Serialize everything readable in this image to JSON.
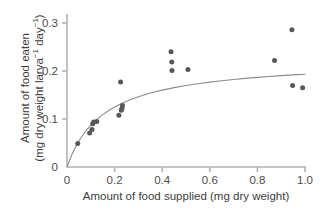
{
  "chart_data": {
    "type": "scatter",
    "title": "",
    "subtitle": "",
    "xlabel": "Amount of food supplied (mg dry weight)",
    "ylabel_line1": "Amount of food eaten",
    "ylabel_line2_prefix": "(mg dry weight larva",
    "ylabel_line2_sup1": "−1",
    "ylabel_line2_mid": " day",
    "ylabel_line2_sup2": "−1",
    "ylabel_line2_suffix": ")",
    "ylabel_full": "Amount of food eaten (mg dry weight larva−1 day−1)",
    "xlim": [
      0,
      1.0
    ],
    "ylim": [
      0,
      0.32
    ],
    "xticks": [
      0,
      0.2,
      0.4,
      0.6,
      0.8,
      1.0
    ],
    "xtick_labels": [
      "0",
      "0.2",
      "0.4",
      "0.6",
      "0.8",
      "1.0"
    ],
    "yticks": [
      0,
      0.1,
      0.2,
      0.3
    ],
    "ytick_labels": [
      "0",
      "0.1",
      "0.2",
      "0.3"
    ],
    "grid": false,
    "legend": "none",
    "marker_color": "#585858",
    "axis_color": "#b3b3b3",
    "curve_color": "#8c8c8c",
    "points": [
      {
        "x": 0.045,
        "y": 0.049
      },
      {
        "x": 0.095,
        "y": 0.071
      },
      {
        "x": 0.105,
        "y": 0.078
      },
      {
        "x": 0.108,
        "y": 0.09
      },
      {
        "x": 0.112,
        "y": 0.094
      },
      {
        "x": 0.125,
        "y": 0.095
      },
      {
        "x": 0.218,
        "y": 0.108
      },
      {
        "x": 0.228,
        "y": 0.118
      },
      {
        "x": 0.231,
        "y": 0.122
      },
      {
        "x": 0.233,
        "y": 0.128
      },
      {
        "x": 0.225,
        "y": 0.177
      },
      {
        "x": 0.437,
        "y": 0.24
      },
      {
        "x": 0.44,
        "y": 0.219
      },
      {
        "x": 0.441,
        "y": 0.201
      },
      {
        "x": 0.508,
        "y": 0.203
      },
      {
        "x": 0.872,
        "y": 0.222
      },
      {
        "x": 0.945,
        "y": 0.286
      },
      {
        "x": 0.948,
        "y": 0.17
      },
      {
        "x": 0.99,
        "y": 0.165
      }
    ],
    "curve_description": "Saturating (Michaelis-Menten type) fitted curve rising from origin to asymptote near 0.22",
    "curve_asymptote": 0.222,
    "curve_half_saturation": 0.155,
    "curve_points": [
      {
        "x": 0.0,
        "y": 0.0
      },
      {
        "x": 0.02,
        "y": 0.0253
      },
      {
        "x": 0.04,
        "y": 0.0455
      },
      {
        "x": 0.06,
        "y": 0.0619
      },
      {
        "x": 0.08,
        "y": 0.0756
      },
      {
        "x": 0.1,
        "y": 0.0871
      },
      {
        "x": 0.14,
        "y": 0.1055
      },
      {
        "x": 0.18,
        "y": 0.1193
      },
      {
        "x": 0.22,
        "y": 0.1302
      },
      {
        "x": 0.26,
        "y": 0.1389
      },
      {
        "x": 0.3,
        "y": 0.1463
      },
      {
        "x": 0.35,
        "y": 0.154
      },
      {
        "x": 0.4,
        "y": 0.1602
      },
      {
        "x": 0.45,
        "y": 0.1654
      },
      {
        "x": 0.5,
        "y": 0.1698
      },
      {
        "x": 0.55,
        "y": 0.1736
      },
      {
        "x": 0.6,
        "y": 0.1769
      },
      {
        "x": 0.65,
        "y": 0.1798
      },
      {
        "x": 0.7,
        "y": 0.1824
      },
      {
        "x": 0.75,
        "y": 0.1847
      },
      {
        "x": 0.8,
        "y": 0.1868
      },
      {
        "x": 0.85,
        "y": 0.1886
      },
      {
        "x": 0.9,
        "y": 0.1903
      },
      {
        "x": 0.95,
        "y": 0.1919
      },
      {
        "x": 1.0,
        "y": 0.1933
      }
    ]
  }
}
